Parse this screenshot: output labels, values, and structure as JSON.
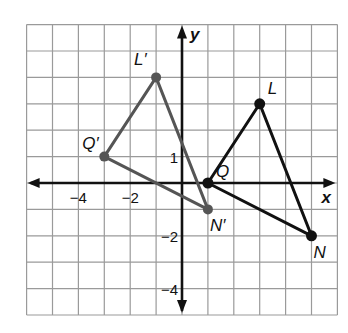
{
  "diagram": {
    "type": "coordinate-plane-transformation",
    "axes": {
      "x_label": "x",
      "y_label": "y",
      "x_range": [
        -6,
        6
      ],
      "y_range": [
        -5,
        6
      ],
      "grid_step": 1
    },
    "tick_labels": {
      "x": [
        {
          "value": -4,
          "text": "−4"
        },
        {
          "value": -2,
          "text": "−2"
        }
      ],
      "y": [
        {
          "value": 1,
          "text": "1"
        },
        {
          "value": -2,
          "text": "−2"
        },
        {
          "value": -4,
          "text": "−4"
        }
      ]
    },
    "original_triangle": {
      "color": "#111111",
      "vertices": [
        {
          "name": "Q",
          "label": "Q",
          "x": 1,
          "y": 0
        },
        {
          "name": "L",
          "label": "L",
          "x": 3,
          "y": 3
        },
        {
          "name": "N",
          "label": "N",
          "x": 5,
          "y": -2
        }
      ]
    },
    "image_triangle": {
      "color": "#555555",
      "vertices": [
        {
          "name": "Q'",
          "label": "Q′",
          "x": -3,
          "y": 1
        },
        {
          "name": "L'",
          "label": "L′",
          "x": -1,
          "y": 4
        },
        {
          "name": "N'",
          "label": "N′",
          "x": 1,
          "y": -1
        }
      ]
    },
    "colors": {
      "grid": "#9a9a9a",
      "axis": "#111111",
      "background": "#ffffff"
    }
  }
}
